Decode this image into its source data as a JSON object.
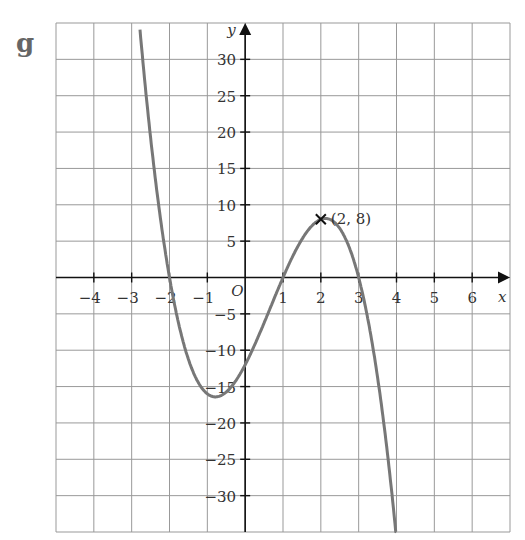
{
  "part_label": "g",
  "point_label": "(2, 8)",
  "origin_label": "O",
  "chart_data": {
    "type": "line",
    "title": "",
    "xlabel": "x",
    "ylabel": "y",
    "equation": "y = -2(x+2)(x-1)(x-3)",
    "xlim": [
      -5,
      7
    ],
    "ylim": [
      -35,
      35
    ],
    "grid": true,
    "x_ticks": [
      -4,
      -3,
      -2,
      -1,
      1,
      2,
      3,
      4,
      5,
      6
    ],
    "y_ticks": [
      -30,
      -25,
      -20,
      -15,
      -10,
      -5,
      5,
      10,
      15,
      20,
      25,
      30
    ],
    "series": [
      {
        "name": "curve",
        "color": "#777777",
        "x": [
          -3,
          -2,
          -1,
          0,
          1,
          2,
          3,
          4
        ],
        "y": [
          48,
          0,
          -16,
          -12,
          0,
          8,
          0,
          -36
        ]
      }
    ],
    "annotations": [
      {
        "x": 2,
        "y": 8,
        "marker": "x",
        "text": "(2, 8)"
      }
    ],
    "roots": [
      -2,
      1,
      3
    ]
  }
}
